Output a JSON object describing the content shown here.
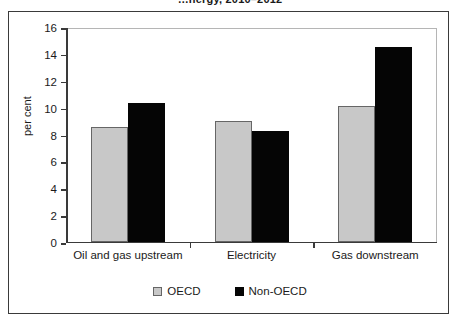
{
  "figure": {
    "title_clipped": "…nergy, 2010–2012",
    "frame_color": "#3a3a3a",
    "background": "#ffffff"
  },
  "chart_data": {
    "type": "bar",
    "title": "…nergy, 2010–2012",
    "categories": [
      "Oil and gas upstream",
      "Electricity",
      "Gas downstream"
    ],
    "series": [
      {
        "name": "OECD",
        "color": "#c8c8c8",
        "values": [
          8.5,
          9.0,
          10.1
        ]
      },
      {
        "name": "Non-OECD",
        "color": "#050505",
        "values": [
          10.3,
          8.2,
          14.5
        ]
      }
    ],
    "xlabel": "",
    "ylabel": "per cent",
    "ylim": [
      0,
      16
    ],
    "ytick_step": 2,
    "yticks": [
      "16",
      "14",
      "12",
      "10",
      "8",
      "6",
      "4",
      "2",
      "0"
    ],
    "grid": false,
    "legend_position": "bottom-center"
  },
  "legend": {
    "items": [
      {
        "label": "OECD",
        "swatch": "grey-square"
      },
      {
        "label": "Non-OECD",
        "swatch": "black-square"
      }
    ]
  }
}
